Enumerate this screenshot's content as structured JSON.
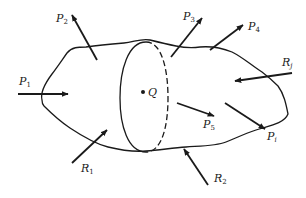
{
  "figure": {
    "stroke_color": "#1a1a1a",
    "background": "#ffffff",
    "point": {
      "label": "Q"
    },
    "loads": [
      {
        "id": "P1",
        "base": "P",
        "sub": "1"
      },
      {
        "id": "P2",
        "base": "P",
        "sub": "2"
      },
      {
        "id": "P3",
        "base": "P",
        "sub": "3"
      },
      {
        "id": "P4",
        "base": "P",
        "sub": "4"
      },
      {
        "id": "P5",
        "base": "P",
        "sub": "5"
      },
      {
        "id": "Pi",
        "base": "P",
        "sub": "i"
      }
    ],
    "reactions": [
      {
        "id": "R1",
        "base": "R",
        "sub": "1"
      },
      {
        "id": "R2",
        "base": "R",
        "sub": "2"
      },
      {
        "id": "Rj",
        "base": "R",
        "sub": "j"
      }
    ]
  }
}
